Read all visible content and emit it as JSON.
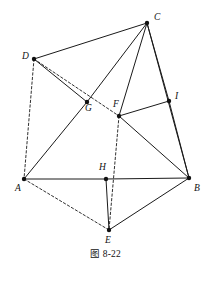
{
  "figure": {
    "caption": "图 8-22",
    "width": 211,
    "height": 281,
    "background_color": "#ffffff",
    "stroke_color": "#1a1a1a",
    "vertex_color": "#111111",
    "vertices": [
      {
        "id": "A",
        "label": "A",
        "x": 24,
        "y": 179,
        "label_x": 15,
        "label_y": 184
      },
      {
        "id": "B",
        "label": "B",
        "x": 189,
        "y": 178,
        "label_x": 194,
        "label_y": 184
      },
      {
        "id": "C",
        "label": "C",
        "x": 147,
        "y": 23,
        "label_x": 154,
        "label_y": 13
      },
      {
        "id": "D",
        "label": "D",
        "x": 34,
        "y": 59,
        "label_x": 22,
        "label_y": 52
      },
      {
        "id": "E",
        "label": "E",
        "x": 109,
        "y": 230,
        "label_x": 105,
        "label_y": 236
      },
      {
        "id": "F",
        "label": "F",
        "x": 119,
        "y": 116,
        "label_x": 113,
        "label_y": 100
      },
      {
        "id": "G",
        "label": "G",
        "x": 87,
        "y": 102,
        "label_x": 85,
        "label_y": 104
      },
      {
        "id": "H",
        "label": "H",
        "x": 106,
        "y": 179,
        "label_x": 99,
        "label_y": 163
      },
      {
        "id": "I",
        "label": "I",
        "x": 169,
        "y": 101,
        "label_x": 175,
        "label_y": 92
      }
    ],
    "edges": [
      {
        "from": "D",
        "to": "C",
        "style": "solid"
      },
      {
        "from": "D",
        "to": "G",
        "style": "solid"
      },
      {
        "from": "A",
        "to": "G",
        "style": "solid"
      },
      {
        "from": "G",
        "to": "C",
        "style": "solid"
      },
      {
        "from": "C",
        "to": "F",
        "style": "solid"
      },
      {
        "from": "C",
        "to": "I",
        "style": "solid"
      },
      {
        "from": "C",
        "to": "B",
        "style": "solid"
      },
      {
        "from": "F",
        "to": "I",
        "style": "solid"
      },
      {
        "from": "I",
        "to": "B",
        "style": "solid"
      },
      {
        "from": "F",
        "to": "B",
        "style": "solid"
      },
      {
        "from": "A",
        "to": "H",
        "style": "solid"
      },
      {
        "from": "H",
        "to": "B",
        "style": "solid"
      },
      {
        "from": "H",
        "to": "E",
        "style": "solid"
      },
      {
        "from": "E",
        "to": "B",
        "style": "solid"
      },
      {
        "from": "D",
        "to": "F",
        "style": "dashed"
      },
      {
        "from": "D",
        "to": "A",
        "style": "dashed"
      },
      {
        "from": "A",
        "to": "E",
        "style": "dashed"
      },
      {
        "from": "F",
        "to": "E",
        "style": "dashed"
      }
    ]
  }
}
